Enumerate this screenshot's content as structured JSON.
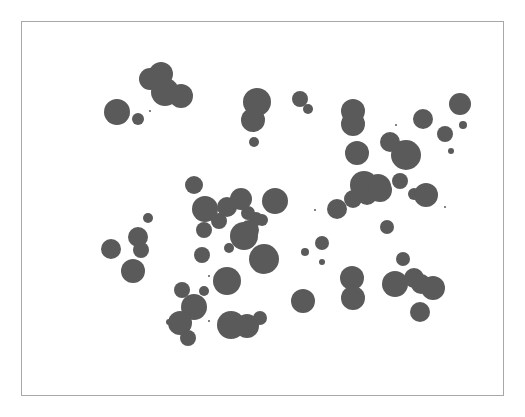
{
  "chart_data": {
    "type": "scatter",
    "subtype": "bubble",
    "title": "",
    "xlabel": "",
    "ylabel": "",
    "grid": false,
    "legend": null,
    "axes_visible": false,
    "marker_color": "#5a5a5a",
    "frame_color": "#a8a8a8",
    "background": "#ffffff",
    "coordinate_space": "pixels (image coords)",
    "points": [
      {
        "x": 117,
        "y": 112,
        "r": 13
      },
      {
        "x": 138,
        "y": 119,
        "r": 6
      },
      {
        "x": 150,
        "y": 79,
        "r": 11
      },
      {
        "x": 161,
        "y": 74,
        "r": 12
      },
      {
        "x": 165,
        "y": 92,
        "r": 14
      },
      {
        "x": 181,
        "y": 96,
        "r": 12
      },
      {
        "x": 150,
        "y": 111,
        "r": 1
      },
      {
        "x": 257,
        "y": 102,
        "r": 14
      },
      {
        "x": 253,
        "y": 120,
        "r": 12
      },
      {
        "x": 254,
        "y": 142,
        "r": 5
      },
      {
        "x": 300,
        "y": 99,
        "r": 8
      },
      {
        "x": 308,
        "y": 109,
        "r": 5
      },
      {
        "x": 353,
        "y": 111,
        "r": 12
      },
      {
        "x": 353,
        "y": 124,
        "r": 12
      },
      {
        "x": 357,
        "y": 153,
        "r": 12
      },
      {
        "x": 390,
        "y": 142,
        "r": 10
      },
      {
        "x": 406,
        "y": 155,
        "r": 15
      },
      {
        "x": 423,
        "y": 119,
        "r": 10
      },
      {
        "x": 445,
        "y": 134,
        "r": 8
      },
      {
        "x": 460,
        "y": 104,
        "r": 11
      },
      {
        "x": 463,
        "y": 125,
        "r": 4
      },
      {
        "x": 451,
        "y": 151,
        "r": 3
      },
      {
        "x": 396,
        "y": 125,
        "r": 1
      },
      {
        "x": 337,
        "y": 209,
        "r": 10
      },
      {
        "x": 353,
        "y": 199,
        "r": 9
      },
      {
        "x": 364,
        "y": 185,
        "r": 14
      },
      {
        "x": 378,
        "y": 187,
        "r": 13
      },
      {
        "x": 367,
        "y": 195,
        "r": 10
      },
      {
        "x": 380,
        "y": 190,
        "r": 12
      },
      {
        "x": 400,
        "y": 181,
        "r": 8
      },
      {
        "x": 414,
        "y": 194,
        "r": 6
      },
      {
        "x": 426,
        "y": 195,
        "r": 12
      },
      {
        "x": 387,
        "y": 227,
        "r": 7
      },
      {
        "x": 445,
        "y": 207,
        "r": 1
      },
      {
        "x": 315,
        "y": 210,
        "r": 1
      },
      {
        "x": 194,
        "y": 185,
        "r": 9
      },
      {
        "x": 205,
        "y": 209,
        "r": 13
      },
      {
        "x": 204,
        "y": 230,
        "r": 8
      },
      {
        "x": 219,
        "y": 221,
        "r": 8
      },
      {
        "x": 227,
        "y": 207,
        "r": 10
      },
      {
        "x": 241,
        "y": 199,
        "r": 11
      },
      {
        "x": 248,
        "y": 213,
        "r": 7
      },
      {
        "x": 256,
        "y": 219,
        "r": 7
      },
      {
        "x": 262,
        "y": 220,
        "r": 6
      },
      {
        "x": 249,
        "y": 230,
        "r": 10
      },
      {
        "x": 244,
        "y": 236,
        "r": 14
      },
      {
        "x": 275,
        "y": 201,
        "r": 13
      },
      {
        "x": 202,
        "y": 255,
        "r": 8
      },
      {
        "x": 229,
        "y": 248,
        "r": 5
      },
      {
        "x": 264,
        "y": 259,
        "r": 15
      },
      {
        "x": 227,
        "y": 281,
        "r": 14
      },
      {
        "x": 209,
        "y": 276,
        "r": 1
      },
      {
        "x": 148,
        "y": 218,
        "r": 5
      },
      {
        "x": 111,
        "y": 249,
        "r": 10
      },
      {
        "x": 138,
        "y": 237,
        "r": 10
      },
      {
        "x": 141,
        "y": 250,
        "r": 8
      },
      {
        "x": 133,
        "y": 271,
        "r": 12
      },
      {
        "x": 182,
        "y": 290,
        "r": 8
      },
      {
        "x": 204,
        "y": 291,
        "r": 5
      },
      {
        "x": 194,
        "y": 307,
        "r": 13
      },
      {
        "x": 180,
        "y": 323,
        "r": 12
      },
      {
        "x": 188,
        "y": 338,
        "r": 8
      },
      {
        "x": 169,
        "y": 322,
        "r": 3
      },
      {
        "x": 209,
        "y": 321,
        "r": 1
      },
      {
        "x": 231,
        "y": 325,
        "r": 14
      },
      {
        "x": 247,
        "y": 326,
        "r": 12
      },
      {
        "x": 260,
        "y": 318,
        "r": 7
      },
      {
        "x": 322,
        "y": 243,
        "r": 7
      },
      {
        "x": 305,
        "y": 252,
        "r": 4
      },
      {
        "x": 322,
        "y": 262,
        "r": 3
      },
      {
        "x": 303,
        "y": 301,
        "r": 12
      },
      {
        "x": 352,
        "y": 278,
        "r": 12
      },
      {
        "x": 353,
        "y": 298,
        "r": 12
      },
      {
        "x": 403,
        "y": 259,
        "r": 7
      },
      {
        "x": 395,
        "y": 284,
        "r": 13
      },
      {
        "x": 414,
        "y": 278,
        "r": 10
      },
      {
        "x": 421,
        "y": 284,
        "r": 10
      },
      {
        "x": 433,
        "y": 288,
        "r": 12
      },
      {
        "x": 420,
        "y": 312,
        "r": 10
      }
    ]
  }
}
